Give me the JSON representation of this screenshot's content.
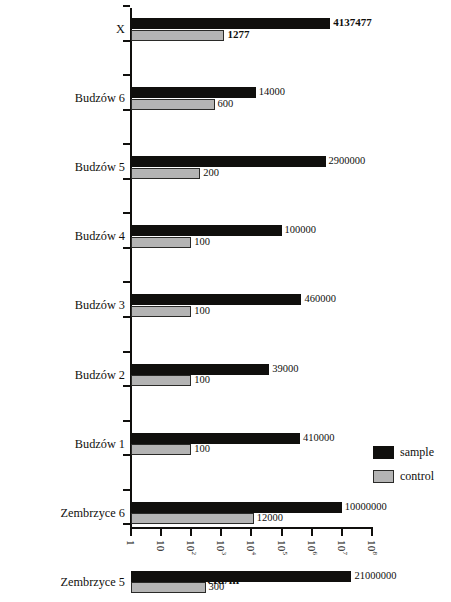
{
  "chart_data": {
    "type": "bar",
    "orientation": "horizontal",
    "title": "",
    "xlabel": "cfu/m³",
    "ylabel": "",
    "xscale": "log",
    "xlim": [
      1,
      100000000
    ],
    "xticks": [
      "1",
      "10",
      "10²",
      "10³",
      "10⁴",
      "10⁵",
      "10⁶",
      "10⁷",
      "10⁸"
    ],
    "xtick_exponents": [
      "",
      "",
      "2",
      "3",
      "4",
      "5",
      "6",
      "7",
      "8"
    ],
    "xtick_bases": [
      "1",
      "10",
      "10",
      "10",
      "10",
      "10",
      "10",
      "10",
      "10"
    ],
    "grid": false,
    "legend_position": "right",
    "categories": [
      "X",
      "Budzów 6",
      "Budzów 5",
      "Budzów 4",
      "Budzów 3",
      "Budzów 2",
      "Budzów 1",
      "Zembrzyce 6",
      "Zembrzyce 5",
      "Zembrzyce 4",
      "Zembrzyce 3",
      "Zembrzyce 2",
      "Zembrzyce 1",
      "Maków Podhalański 3",
      "Maków Podhalański 2",
      "Baczyn 1"
    ],
    "series": [
      {
        "name": "sample",
        "color": "#100f0d",
        "values": [
          4137477,
          14000,
          2900000,
          100000,
          460000,
          39000,
          410000,
          10000000,
          21000000,
          1500000,
          6100000,
          19000,
          150,
          170000,
          350000,
          19000000
        ],
        "labels": [
          "4137477",
          "14000",
          "2900000",
          "100000",
          "460000",
          "39000",
          "410000",
          "10000000",
          "21000000",
          "1500000",
          "6100000",
          "19000",
          "150",
          "170000",
          "350000",
          "19000000"
        ],
        "label_bold": [
          true,
          false,
          false,
          false,
          false,
          false,
          false,
          false,
          false,
          false,
          false,
          false,
          false,
          false,
          false,
          false
        ]
      },
      {
        "name": "control",
        "color": "#b4b4b4",
        "values": [
          1277,
          600,
          200,
          100,
          100,
          100,
          100,
          12000,
          300,
          4000,
          100,
          350,
          100,
          400,
          150,
          550
        ],
        "labels": [
          "1277",
          "600",
          "200",
          "100",
          "100",
          "100",
          "100",
          "12000",
          "300",
          "4000",
          "100",
          "350",
          "100",
          "400",
          "150",
          "550"
        ],
        "label_bold": [
          true,
          false,
          false,
          false,
          false,
          false,
          false,
          false,
          false,
          false,
          false,
          false,
          false,
          false,
          false,
          false
        ]
      }
    ]
  },
  "legend": {
    "items": [
      {
        "label": "sample",
        "color": "#100f0d"
      },
      {
        "label": "control",
        "color": "#b4b4b4"
      }
    ]
  },
  "axis": {
    "x_title_base": "cfu/m",
    "x_title_exponent": "3"
  }
}
